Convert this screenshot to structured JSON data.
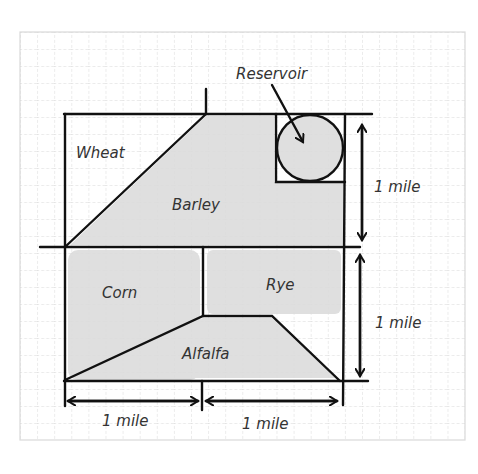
{
  "diagram": {
    "type": "farm-plot-map",
    "colors": {
      "background": "#ffffff",
      "grid_line": "#c9c9c9",
      "fill": "#dcdcdc",
      "stroke": "#111111",
      "text": "#333333"
    },
    "regions": [
      {
        "name": "Wheat",
        "label": "Wheat"
      },
      {
        "name": "Barley",
        "label": "Barley"
      },
      {
        "name": "Reservoir",
        "label": "Reservoir"
      },
      {
        "name": "Corn",
        "label": "Corn"
      },
      {
        "name": "Rye",
        "label": "Rye"
      },
      {
        "name": "Alfalfa",
        "label": "Alfalfa"
      }
    ],
    "dimensions": {
      "right_top": "1 mile",
      "right_bottom": "1 mile",
      "bottom_left": "1 mile",
      "bottom_right": "1 mile"
    }
  }
}
